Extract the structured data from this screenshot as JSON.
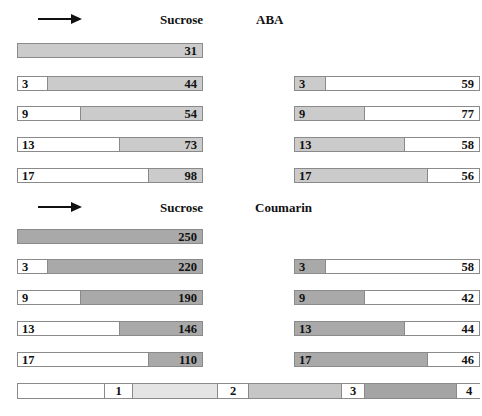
{
  "colors": {
    "aba_fill": "#cbcbcb",
    "coumarin_fill": "#a9a9a9",
    "legend_1": "#ffffff",
    "legend_2": "#e4e4e4",
    "legend_3": "#c6c6c6",
    "legend_4": "#a4a4a4",
    "border": "#8a8a8a"
  },
  "panels": [
    {
      "name": "aba",
      "arrow": "right-arrow",
      "left_header": "Sucrose",
      "right_header": "ABA",
      "left_bars": [
        {
          "left_label": "",
          "right_label": "31",
          "split_px": 0
        },
        {
          "left_label": "3",
          "right_label": "44",
          "split_px": 30
        },
        {
          "left_label": "9",
          "right_label": "54",
          "split_px": 63
        },
        {
          "left_label": "13",
          "right_label": "73",
          "split_px": 102
        },
        {
          "left_label": "17",
          "right_label": "98",
          "split_px": 131
        }
      ],
      "right_bars": [
        {
          "left_label": "3",
          "right_label": "59",
          "split_px": 30
        },
        {
          "left_label": "9",
          "right_label": "77",
          "split_px": 69
        },
        {
          "left_label": "13",
          "right_label": "58",
          "split_px": 109
        },
        {
          "left_label": "17",
          "right_label": "56",
          "split_px": 132
        }
      ]
    },
    {
      "name": "coumarin",
      "arrow": "right-arrow",
      "left_header": "Sucrose",
      "right_header": "Coumarin",
      "left_bars": [
        {
          "left_label": "",
          "right_label": "250",
          "split_px": 0
        },
        {
          "left_label": "3",
          "right_label": "220",
          "split_px": 30
        },
        {
          "left_label": "9",
          "right_label": "190",
          "split_px": 63
        },
        {
          "left_label": "13",
          "right_label": "146",
          "split_px": 102
        },
        {
          "left_label": "17",
          "right_label": "110",
          "split_px": 131
        }
      ],
      "right_bars": [
        {
          "left_label": "3",
          "right_label": "58",
          "split_px": 30
        },
        {
          "left_label": "9",
          "right_label": "42",
          "split_px": 69
        },
        {
          "left_label": "13",
          "right_label": "44",
          "split_px": 109
        },
        {
          "left_label": "17",
          "right_label": "46",
          "split_px": 132
        }
      ]
    }
  ],
  "legend": {
    "items": [
      {
        "label": "1"
      },
      {
        "label": "2"
      },
      {
        "label": "3"
      },
      {
        "label": "4"
      }
    ]
  }
}
